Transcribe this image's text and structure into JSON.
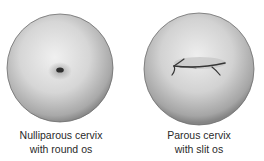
{
  "figures": [
    {
      "id": "nulliparous",
      "label_line1": "Nulliparous cervix",
      "label_line2": "with round os",
      "os_shape": "round"
    },
    {
      "id": "parous",
      "label_line1": "Parous cervix",
      "label_line2": "with slit os",
      "os_shape": "slit"
    }
  ],
  "colors": {
    "cervix_light": "#e8e8e8",
    "cervix_mid": "#bdbdbd",
    "cervix_edge": "#7a7a7a",
    "os": "#2f2f2f",
    "text": "#2a2a2a"
  }
}
